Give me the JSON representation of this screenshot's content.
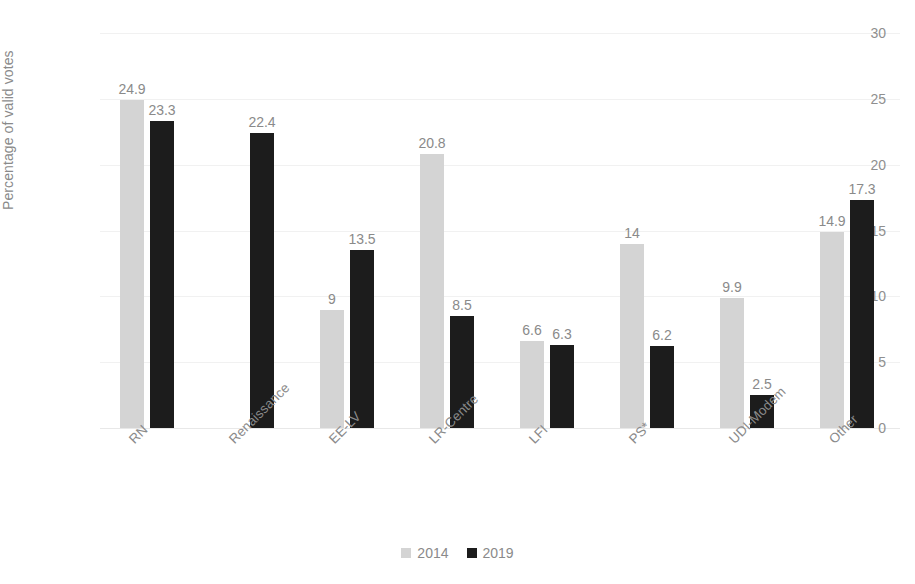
{
  "chart_data": {
    "type": "bar",
    "title": "",
    "xlabel": "",
    "ylabel": "Percentage of valid votes",
    "ylim": [
      0,
      30
    ],
    "yticks": [
      0,
      5,
      10,
      15,
      20,
      25,
      30
    ],
    "ytick_labels": [
      "0",
      "5",
      "10",
      "15",
      "20",
      "25",
      "30"
    ],
    "grid": true,
    "legend_position": "bottom",
    "categories": [
      "RN",
      "Renaissance",
      "EE-LV",
      "LR-Centre",
      "LFI",
      "PS*",
      "UDI-Modem",
      "Other"
    ],
    "series": [
      {
        "name": "2014",
        "color": "#d4d4d4",
        "values": [
          24.9,
          null,
          9,
          20.8,
          6.6,
          14,
          9.9,
          14.9
        ],
        "labels": [
          "24.9",
          "",
          "9",
          "20.8",
          "6.6",
          "14",
          "9.9",
          "14.9"
        ]
      },
      {
        "name": "2019",
        "color": "#1c1c1c",
        "values": [
          23.3,
          22.4,
          13.5,
          8.5,
          6.3,
          6.2,
          2.5,
          17.3
        ],
        "labels": [
          "23.3",
          "22.4",
          "13.5",
          "8.5",
          "6.3",
          "6.2",
          "2.5",
          "17.3"
        ]
      }
    ]
  },
  "legend": {
    "items": [
      {
        "label": "2014",
        "color": "#d4d4d4"
      },
      {
        "label": "2019",
        "color": "#1c1c1c"
      }
    ]
  }
}
